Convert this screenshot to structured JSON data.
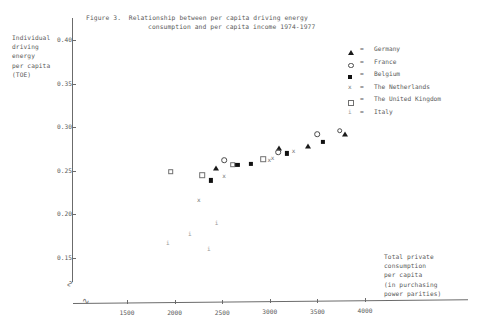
{
  "figure": {
    "title_line1": "Figure 3.  Relationship between per capita driving energy",
    "title_line2": "consumption and per capita income 1974-1977"
  },
  "axes": {
    "y_label_lines": [
      "Individual",
      "driving",
      "energy",
      "per capita",
      "(TOE)"
    ],
    "x_label_lines": [
      "Total private",
      "consumption",
      "per capita",
      "(in purchasing",
      "power parities)"
    ],
    "y_ticks": [
      "0.40",
      "0.35",
      "0.30",
      "0.25",
      "0.20",
      "0.15"
    ],
    "x_ticks": [
      "1500",
      "2000",
      "2500",
      "3000",
      "3500",
      "4000"
    ],
    "y_break_glyph": "∿",
    "x_break_glyph": "∿"
  },
  "legend": {
    "equals": "=",
    "items": [
      {
        "symbol": "filled-triangle",
        "label": "Germany",
        "key": "germany"
      },
      {
        "symbol": "open-circle",
        "label": "France",
        "key": "france"
      },
      {
        "symbol": "filled-square",
        "label": "Belgium",
        "key": "belgium"
      },
      {
        "symbol": "letter-x",
        "label": "The Netherlands",
        "key": "netherlands",
        "glyph": "x"
      },
      {
        "symbol": "open-square",
        "label": "The United Kingdom",
        "key": "uk"
      },
      {
        "symbol": "letter-i",
        "label": "Italy",
        "key": "italy",
        "glyph": "i"
      }
    ]
  },
  "chart_data": {
    "type": "scatter",
    "title": "Figure 3. Relationship between per capita driving energy consumption and per capita income 1974-1977",
    "xlabel": "Total private consumption per capita (in purchasing power parities)",
    "ylabel": "Individual driving energy per capita (TOE)",
    "xlim": [
      1150,
      4300
    ],
    "ylim": [
      0.13,
      0.41
    ],
    "xticks": [
      1500,
      2000,
      2500,
      3000,
      3500,
      4000
    ],
    "yticks": [
      0.15,
      0.2,
      0.25,
      0.3,
      0.35,
      0.4
    ],
    "grid": false,
    "axis_break": true,
    "legend_position": "top-right",
    "series": [
      {
        "name": "Germany",
        "marker": "filled-triangle",
        "points": [
          [
            2435,
            0.253
          ],
          [
            3095,
            0.276
          ],
          [
            3400,
            0.279
          ],
          [
            3790,
            0.292
          ]
        ]
      },
      {
        "name": "France",
        "marker": "open-circle",
        "points": [
          [
            2520,
            0.262
          ],
          [
            3090,
            0.271
          ],
          [
            3500,
            0.292
          ],
          [
            3735,
            0.296
          ]
        ]
      },
      {
        "name": "Belgium",
        "marker": "filled-square",
        "points": [
          [
            2380,
            0.239
          ],
          [
            2660,
            0.257
          ],
          [
            2800,
            0.258
          ],
          [
            3180,
            0.27
          ],
          [
            3560,
            0.283
          ]
        ]
      },
      {
        "name": "The Netherlands",
        "marker": "letter-x",
        "points": [
          [
            2255,
            0.216
          ],
          [
            2520,
            0.244
          ],
          [
            2995,
            0.262
          ],
          [
            3030,
            0.265
          ],
          [
            3250,
            0.273
          ]
        ]
      },
      {
        "name": "The United Kingdom",
        "marker": "open-square",
        "points": [
          [
            1960,
            0.249
          ],
          [
            2290,
            0.245
          ],
          [
            2610,
            0.257
          ],
          [
            2930,
            0.263
          ]
        ]
      },
      {
        "name": "Italy",
        "marker": "letter-i",
        "points": [
          [
            1930,
            0.167
          ],
          [
            2160,
            0.177
          ],
          [
            2440,
            0.19
          ],
          [
            2360,
            0.16
          ]
        ]
      }
    ]
  }
}
